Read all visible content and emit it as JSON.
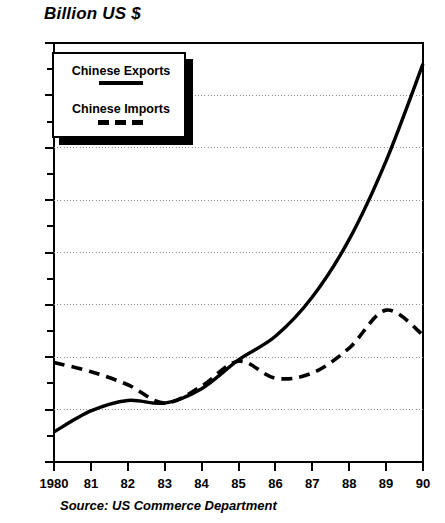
{
  "chart_data": {
    "type": "line",
    "title": "Billion US $",
    "xlabel": "",
    "ylabel": "Billion US $",
    "source": "Source:  US Commerce Department",
    "grid": true,
    "legend_position": "top-left",
    "xlim": [
      1980,
      1990
    ],
    "ylim": [
      0,
      16
    ],
    "ytick_step": 2,
    "x": [
      1980,
      1981,
      1982,
      1983,
      1984,
      1985,
      1986,
      1987,
      1988,
      1989,
      1990
    ],
    "categories": [
      "1980",
      "81",
      "82",
      "83",
      "84",
      "85",
      "86",
      "87",
      "88",
      "89",
      "90"
    ],
    "ytick_labels": [
      "0",
      "2",
      "4",
      "6",
      "8",
      "10",
      "12",
      "14",
      "16"
    ],
    "ytick_values": [
      0,
      2,
      4,
      6,
      8,
      10,
      12,
      14,
      16
    ],
    "yminor_values": [
      1,
      3,
      5,
      7,
      9,
      11,
      13,
      15
    ],
    "series": [
      {
        "name": "Chinese Exports",
        "style": "solid",
        "color": "#000000",
        "values": [
          1.15,
          1.95,
          2.35,
          2.25,
          2.8,
          3.9,
          4.8,
          6.3,
          8.5,
          11.5,
          15.2
        ]
      },
      {
        "name": "Chinese Imports",
        "style": "dashed",
        "color": "#000000",
        "values": [
          3.8,
          3.45,
          2.95,
          2.25,
          2.9,
          3.85,
          3.2,
          3.4,
          4.35,
          5.8,
          4.85
        ]
      }
    ]
  },
  "legend": {
    "items": [
      {
        "label": "Chinese Exports",
        "style": "solid"
      },
      {
        "label": "Chinese Imports",
        "style": "dashed"
      }
    ]
  },
  "colors": {
    "ink": "#000000",
    "background": "#ffffff",
    "grid": "#8a8a8a"
  }
}
